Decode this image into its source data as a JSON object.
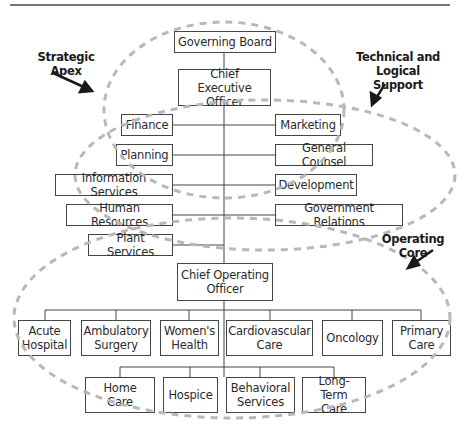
{
  "diagram": {
    "type": "organizational-chart",
    "annotations": {
      "strategic_apex": "Strategic Apex",
      "technical_support": "Technical and\nLogical Support",
      "operating_core": "Operating Core"
    },
    "top": {
      "governing_board": "Governing Board",
      "ceo": "Chief Executive\nOfficer"
    },
    "left_staff": [
      "Finance",
      "Planning",
      "Information Services",
      "Human Resources",
      "Plant Services"
    ],
    "right_staff": [
      "Marketing",
      "General Counsel",
      "Development",
      "Government Relations"
    ],
    "coo": "Chief Operating\nOfficer",
    "service_lines_row1": [
      "Acute\nHospital",
      "Ambulatory\nSurgery",
      "Women's\nHealth",
      "Cardiovascular\nCare",
      "Oncology",
      "Primary\nCare"
    ],
    "service_lines_row2": [
      "Home Care",
      "Hospice",
      "Behavioral\nServices",
      "Long-Term\nCare"
    ],
    "colors": {
      "line": "#444444",
      "dashed_outline": "#b8b8b8",
      "arrow": "#1a1a1a"
    }
  }
}
